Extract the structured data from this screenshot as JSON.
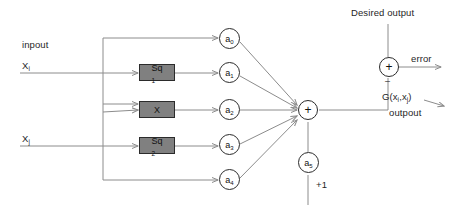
{
  "diagram": {
    "background_color": "#ffffff",
    "wire_color": "#8c8c8c",
    "box_fill_color": "#808080",
    "box_border_color": "#2b2b2b",
    "node_border_color": "#2b2b2b",
    "text_color": "#1f1f1f"
  },
  "inputs": {
    "input_caption": "inpout",
    "input_1_label": "X",
    "input_1_sub": "i",
    "input_2_label": "X",
    "input_2_sub": "j"
  },
  "blocks": [
    {
      "id": "block-sq-top",
      "label": "Sq",
      "sub": "1"
    },
    {
      "id": "block-x-mid",
      "label": "X",
      "sub": ""
    },
    {
      "id": "block-sq-bottom",
      "label": "Sq",
      "sub": "2"
    }
  ],
  "coefficients": [
    {
      "id": "coef-a0",
      "label": "a",
      "sub": "0"
    },
    {
      "id": "coef-a1",
      "label": "a",
      "sub": "1"
    },
    {
      "id": "coef-a2",
      "label": "a",
      "sub": "2"
    },
    {
      "id": "coef-a3",
      "label": "a",
      "sub": "3"
    },
    {
      "id": "coef-a4",
      "label": "a",
      "sub": "4"
    }
  ],
  "bias": {
    "node_label": "a",
    "node_sub": "5",
    "value_label": "+1"
  },
  "summation": {
    "symbol": "+"
  },
  "error_node": {
    "symbol": "+",
    "minus_sign": "–",
    "desired_output_label": "Desired output",
    "error_label": "error"
  },
  "output": {
    "function_label": "G(x",
    "function_sub_1": "i",
    "function_mid": ",x",
    "function_sub_2": "j",
    "function_close": ")",
    "caption": "outpout"
  }
}
